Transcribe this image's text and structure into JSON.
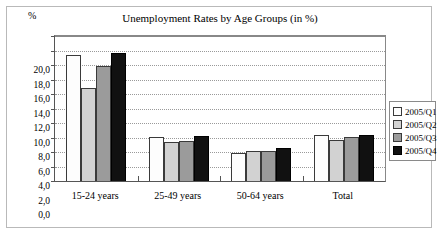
{
  "chart_data": {
    "type": "bar",
    "title": "Unemployment Rates by Age Groups (in %)",
    "unit_label": "%",
    "xlabel": "",
    "ylabel": "",
    "ylim": [
      0,
      20
    ],
    "ytick_step": 2,
    "ytick_labels": [
      "0,0",
      "2,0",
      "4,0",
      "6,0",
      "8,0",
      "10,0",
      "12,0",
      "14,0",
      "16,0",
      "18,0",
      "20,0"
    ],
    "ytick_values": [
      0,
      2,
      4,
      6,
      8,
      10,
      12,
      14,
      16,
      18,
      20
    ],
    "grid": "horizontal-dotted",
    "legend_position": "right",
    "categories": [
      "15-24 years",
      "25-49 years",
      "50-64 years",
      "Total"
    ],
    "series": [
      {
        "name": "2005/Q1",
        "color": "#fdfdfd",
        "values": [
          17.4,
          6.1,
          3.9,
          6.4
        ]
      },
      {
        "name": "2005/Q2",
        "color": "#d2d2d2",
        "values": [
          12.8,
          5.4,
          4.2,
          5.7
        ]
      },
      {
        "name": "2005/Q3",
        "color": "#9b9b9b",
        "values": [
          15.8,
          5.5,
          4.2,
          6.1
        ]
      },
      {
        "name": "2005/Q4",
        "color": "#111111",
        "values": [
          17.7,
          6.2,
          4.5,
          6.4
        ]
      }
    ]
  }
}
